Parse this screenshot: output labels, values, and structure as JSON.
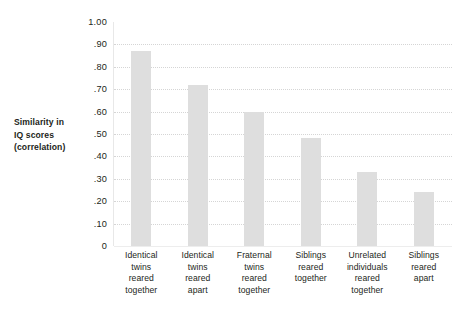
{
  "chart_data": {
    "type": "bar",
    "title": "",
    "xlabel": "",
    "ylabel": "Similarity in IQ scores (correlation)",
    "ylim": [
      0,
      1.0
    ],
    "grid": true,
    "legend": "none",
    "ytick_labels": [
      "1.00",
      ".90",
      ".80",
      ".70",
      ".60",
      ".50",
      ".40",
      ".30",
      ".20",
      ".10",
      "0"
    ],
    "ytick_values": [
      1.0,
      0.9,
      0.8,
      0.7,
      0.6,
      0.5,
      0.4,
      0.3,
      0.2,
      0.1,
      0.0
    ],
    "categories": [
      "Identical twins reared together",
      "Identical twins reared apart",
      "Fraternal twins reared together",
      "Siblings reared together",
      "Unrelated individuals reared together",
      "Siblings reared apart"
    ],
    "category_lines": [
      [
        "Identical",
        "twins",
        "reared",
        "together"
      ],
      [
        "Identical",
        "twins",
        "reared",
        "apart"
      ],
      [
        "Fraternal",
        "twins",
        "reared",
        "together"
      ],
      [
        "Siblings",
        "reared",
        "together"
      ],
      [
        "Unrelated",
        "individuals",
        "reared",
        "together"
      ],
      [
        "Siblings",
        "reared",
        "apart"
      ]
    ],
    "values": [
      0.87,
      0.72,
      0.6,
      0.48,
      0.33,
      0.24
    ],
    "bar_color": "#dedede",
    "grid_color": "#d5d5d5",
    "text_color": "#231f20",
    "background": "#ffffff"
  },
  "axis": {
    "y_title_lines": [
      "Similarity in",
      "IQ scores",
      "(correlation)"
    ]
  }
}
